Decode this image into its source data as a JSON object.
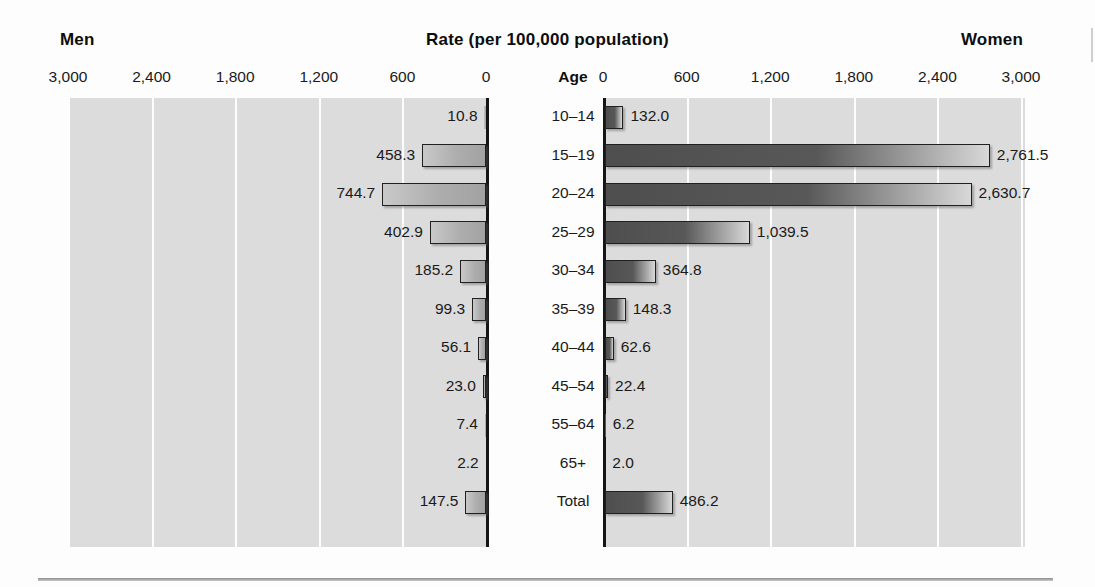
{
  "header": {
    "men_label": "Men",
    "title": "Rate (per 100,000 population)",
    "women_label": "Women",
    "age_column_header": "Age"
  },
  "chart_data": {
    "type": "bar",
    "subtype": "population-pyramid",
    "title": "Rate (per 100,000 population)",
    "xlabel": "Rate (per 100,000 population)",
    "ylabel": "Age",
    "categories": [
      "10–14",
      "15–19",
      "20–24",
      "25–29",
      "30–34",
      "35–39",
      "40–44",
      "45–54",
      "55–64",
      "65+",
      "Total"
    ],
    "series": [
      {
        "name": "Men",
        "side": "left",
        "color": "#adadad",
        "values": [
          10.8,
          458.3,
          744.7,
          402.9,
          185.2,
          99.3,
          56.1,
          23.0,
          7.4,
          2.2,
          147.5
        ],
        "labels": [
          "10.8",
          "458.3",
          "744.7",
          "402.9",
          "185.2",
          "99.3",
          "56.1",
          "23.0",
          "7.4",
          "2.2",
          "147.5"
        ]
      },
      {
        "name": "Women",
        "side": "right",
        "color": "#585858",
        "values": [
          132.0,
          2761.5,
          2630.7,
          1039.5,
          364.8,
          148.3,
          62.6,
          22.4,
          6.2,
          2.0,
          486.2
        ],
        "labels": [
          "132.0",
          "2,761.5",
          "2,630.7",
          "1,039.5",
          "364.8",
          "148.3",
          "62.6",
          "22.4",
          "6.2",
          "2.0",
          "486.2"
        ]
      }
    ],
    "xlim": [
      0,
      3000
    ],
    "left_ticks": [
      "3,000",
      "2,400",
      "1,800",
      "1,200",
      "600",
      "0"
    ],
    "left_tick_values": [
      3000,
      2400,
      1800,
      1200,
      600,
      0
    ],
    "right_ticks": [
      "0",
      "600",
      "1,200",
      "1,800",
      "2,400",
      "3,000"
    ],
    "right_tick_values": [
      0,
      600,
      1200,
      1800,
      2400,
      3000
    ],
    "grid": true,
    "legend_position": "none"
  }
}
